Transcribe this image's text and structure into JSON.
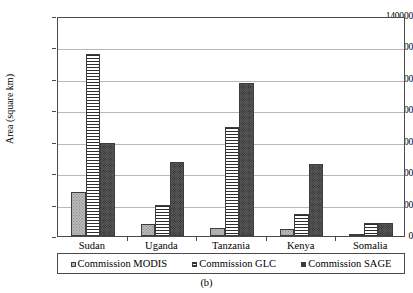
{
  "caption": "(b)",
  "axes": {
    "ylabel": "Area (square km)",
    "xlabel": "",
    "yticks": [
      "0",
      "20000",
      "40000",
      "60000",
      "80000",
      "100000",
      "120000",
      "140000"
    ]
  },
  "legend": {
    "entries": [
      {
        "label": "Commission MODIS",
        "key": "modis"
      },
      {
        "label": "Commission GLC",
        "key": "glc"
      },
      {
        "label": "Commission SAGE",
        "key": "sage"
      }
    ]
  },
  "chart_data": {
    "type": "bar",
    "title": "(b)",
    "xlabel": "",
    "ylabel": "Area (square km)",
    "ylim": [
      0,
      140000
    ],
    "ytick_step": 20000,
    "grid": true,
    "legend_position": "bottom",
    "categories": [
      "Sudan",
      "Uganda",
      "Tanzania",
      "Kenya",
      "Somalia"
    ],
    "series": [
      {
        "name": "Commission MODIS",
        "values": [
          28000,
          7500,
          5000,
          4500,
          1000
        ],
        "color": "#b9b9b9",
        "pattern": "dots-light"
      },
      {
        "name": "Commission GLC",
        "values": [
          116000,
          19500,
          69500,
          14000,
          8000
        ],
        "color": "#ffffff",
        "pattern": "horizontal-lines"
      },
      {
        "name": "Commission SAGE",
        "values": [
          59000,
          47000,
          97500,
          46000,
          8200
        ],
        "color": "#5a5a5a",
        "pattern": "dots-dark"
      }
    ]
  }
}
